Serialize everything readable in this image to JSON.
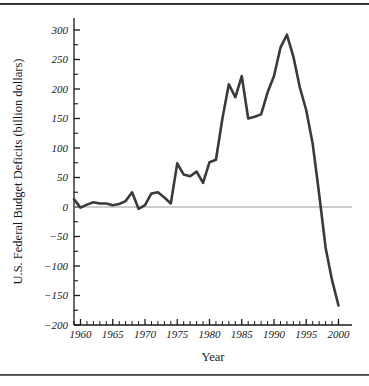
{
  "figure": {
    "background_color": "#ffffff",
    "line_color": "#3a3a3a",
    "zero_line_color": "#9a9a9a",
    "axis_color": "#1a1a1a",
    "rule_top_label": "page-rule-top",
    "rule_bottom_label": "page-rule-bottom"
  },
  "chart_data": {
    "type": "line",
    "title": "",
    "xlabel": "Year",
    "ylabel": "U.S. Federal Budget Deficits (billion dollars)",
    "xlim": [
      1959,
      2000
    ],
    "ylim": [
      -200,
      320
    ],
    "grid": false,
    "legend": null,
    "y_ticks": [
      -200,
      -150,
      -100,
      -50,
      0,
      50,
      100,
      150,
      200,
      250,
      300
    ],
    "y_tick_labels": [
      "-200",
      "-150",
      "-100",
      "-50",
      "0",
      "50",
      "100",
      "150",
      "200",
      "250",
      "300"
    ],
    "y_minor_tick_interval": 25,
    "x_ticks": [
      1960,
      1965,
      1970,
      1975,
      1980,
      1985,
      1990,
      1995,
      2000
    ],
    "x_tick_labels": [
      "1960",
      "1965",
      "1970",
      "1975",
      "1980",
      "1985",
      "1990",
      "1995",
      "2000"
    ],
    "x_minor_tick_interval": 1,
    "zero_reference_line": 0,
    "x": [
      1959,
      1960,
      1961,
      1962,
      1963,
      1964,
      1965,
      1966,
      1967,
      1968,
      1969,
      1970,
      1971,
      1972,
      1973,
      1974,
      1975,
      1976,
      1977,
      1978,
      1979,
      1980,
      1981,
      1982,
      1983,
      1984,
      1985,
      1986,
      1987,
      1988,
      1989,
      1990,
      1991,
      1992,
      1993,
      1994,
      1995,
      1996,
      1997,
      1998,
      1999,
      2000
    ],
    "values": [
      13,
      -1,
      4,
      8,
      6,
      6,
      3,
      5,
      10,
      25,
      -3,
      3,
      23,
      25,
      16,
      6,
      74,
      55,
      52,
      60,
      41,
      76,
      80,
      150,
      208,
      186,
      222,
      150,
      153,
      157,
      194,
      222,
      270,
      292,
      255,
      203,
      164,
      107,
      22,
      -69,
      -124,
      -167
    ],
    "annotations": [
      {
        "label": "peak",
        "x": 1992,
        "y": 292
      },
      {
        "label": "surplus-start",
        "x": 1998,
        "y": -69
      }
    ]
  },
  "axis_titles": {
    "x": "Year",
    "y": "U.S. Federal Budget Deficits (billion dollars)"
  }
}
